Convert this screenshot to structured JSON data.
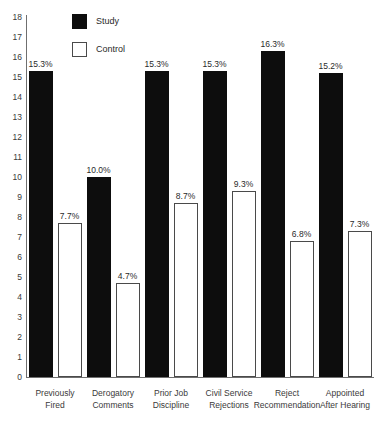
{
  "chart_data": {
    "type": "bar",
    "title": "",
    "xlabel": "",
    "ylabel": "",
    "ylim": [
      0,
      18
    ],
    "ytick_step": 1,
    "grid": false,
    "legend_position": "top-left-inside",
    "categories": [
      "Previously Fired",
      "Derogatory Comments",
      "Prior Job Discipline",
      "Civil Service Rejections",
      "Reject Recommendation",
      "Appointed After Hearing"
    ],
    "category_lines": [
      [
        "Previously",
        "Fired"
      ],
      [
        "Derogatory",
        "Comments"
      ],
      [
        "Prior Job",
        "Discipline"
      ],
      [
        "Civil Service",
        "Rejections"
      ],
      [
        "Reject",
        "Recommendation"
      ],
      [
        "Appointed",
        "After Hearing"
      ]
    ],
    "yticks": [
      "18",
      "17",
      "16",
      "15",
      "14",
      "13",
      "12",
      "11",
      "10",
      "9",
      "8",
      "7",
      "6",
      "5",
      "4",
      "3",
      "2",
      "1",
      "0"
    ],
    "series": [
      {
        "name": "Study",
        "color": "#0d0d0d",
        "style": "filled",
        "values": [
          15.3,
          10.0,
          15.3,
          15.3,
          16.3,
          15.2
        ],
        "labels": [
          "15.3%",
          "10.0%",
          "15.3%",
          "15.3%",
          "16.3%",
          "15.2%"
        ]
      },
      {
        "name": "Control",
        "color": "#ffffff",
        "style": "outlined",
        "values": [
          7.7,
          4.7,
          8.7,
          9.3,
          6.8,
          7.3
        ],
        "labels": [
          "7.7%",
          "4.7%",
          "8.7%",
          "9.3%",
          "6.8%",
          "7.3%"
        ]
      }
    ]
  },
  "legend": {
    "items": [
      {
        "label": "Study"
      },
      {
        "label": "Control"
      }
    ]
  }
}
